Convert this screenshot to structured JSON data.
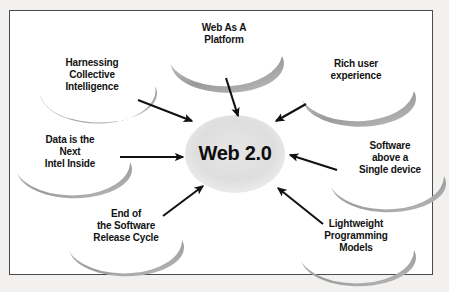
{
  "diagram": {
    "center": {
      "label": "Web 2.0",
      "shape": "ellipse",
      "fill": "#dcdcdc"
    },
    "frame": {
      "border_color": "#4b4b4b",
      "background": "#ffffff",
      "page_background": "#f2f1ef"
    },
    "arrow_color": "#111111",
    "crescent_color": "#9c9c9c",
    "nodes": [
      {
        "id": "web-as-a-platform",
        "label": "Web As A\nPlatform",
        "position": "top",
        "arrow": "points down-left into center"
      },
      {
        "id": "harnessing-collective-intelligence",
        "label": "Harnessing\nCollective\nIntelligence",
        "position": "top-left",
        "arrow": "points down-right into center"
      },
      {
        "id": "rich-user-experience",
        "label": "Rich user\nexperience",
        "position": "top-right",
        "arrow": "points down-left into center"
      },
      {
        "id": "data-is-the-next-intel-inside",
        "label": "Data is the\nNext\nIntel Inside",
        "position": "left",
        "arrow": "points right into center"
      },
      {
        "id": "software-above-a-single-device",
        "label": "Software\nabove a\nSingle device",
        "position": "right",
        "arrow": "points left into center"
      },
      {
        "id": "end-of-the-software-release-cycle",
        "label": "End of\nthe Software\nRelease Cycle",
        "position": "bottom-left",
        "arrow": "points up-right into center"
      },
      {
        "id": "lightweight-programming-models",
        "label": "Lightweight\nProgramming\nModels",
        "position": "bottom-right",
        "arrow": "points up-left into center"
      }
    ]
  }
}
